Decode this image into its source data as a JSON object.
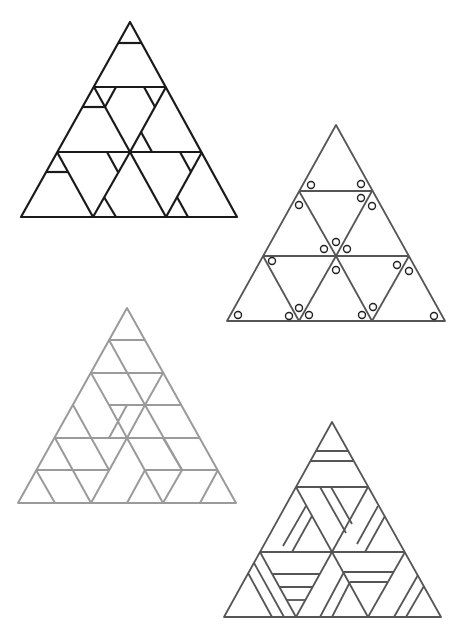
{
  "figure": {
    "panels": [
      {
        "id": "A",
        "position": "top-left",
        "stroke": "#1a1a1a",
        "style": "triangle subdivided into 9 sub-triangles with corner cut lines"
      },
      {
        "id": "B",
        "position": "top-right",
        "stroke": "#555555",
        "style": "9 sub-triangles with small circles marked near corners"
      },
      {
        "id": "C",
        "position": "bottom-left",
        "stroke": "#999999",
        "style": "6-row triangular grid partitioned into parallelograms"
      },
      {
        "id": "D",
        "position": "bottom-right",
        "stroke": "#555555",
        "style": "9 sub-triangles with parallel stripe tilings"
      }
    ]
  },
  "colors": {
    "background": "#ffffff",
    "panel_a": "#1a1a1a",
    "panel_b": "#555555",
    "panel_c": "#9a9a9a",
    "panel_d": "#555555"
  }
}
